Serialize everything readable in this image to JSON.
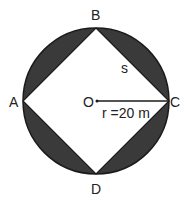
{
  "diagram": {
    "colors": {
      "shade": "#3a3a3a",
      "stroke": "#1a1a1a",
      "background": "#ffffff"
    },
    "labels": {
      "A": "A",
      "B": "B",
      "C": "C",
      "D": "D",
      "O": "O",
      "side": "s",
      "radius": "r =20 m"
    }
  }
}
